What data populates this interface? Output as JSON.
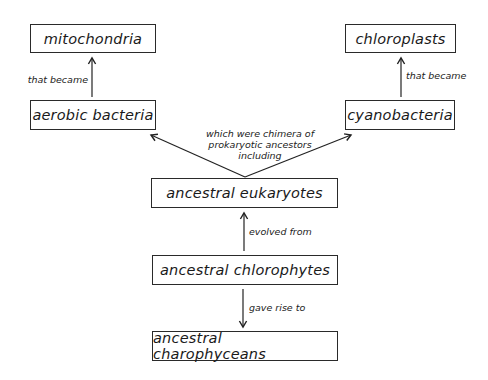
{
  "nodes": {
    "mitochondria": "mitochondria",
    "aerobic_bacteria": "aerobic bacteria",
    "chloroplasts": "chloroplasts",
    "cyanobacteria": "cyanobacteria",
    "eukaryotes": "ancestral eukaryotes",
    "chlorophytes": "ancestral chlorophytes",
    "charophyceans": "ancestral charophyceans"
  },
  "edges": {
    "aerobic_to_mito": "that became",
    "cyano_to_chloro": "that became",
    "chimera_line1": "which were chimera of",
    "chimera_line2": "prokaryotic ancestors",
    "chimera_line3": "including",
    "evolved_from": "evolved from",
    "gave_rise_to": "gave rise to"
  }
}
